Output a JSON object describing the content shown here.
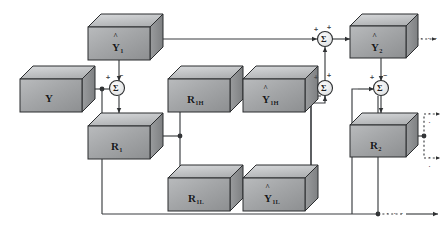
{
  "diagram": {
    "background": "#ffffff",
    "line_color": "#3a3d40",
    "cube_face_color": "#a9abad",
    "cube_top_color": "#c9cbcd",
    "cube_side_color": "#8f9193",
    "cube_edge_color": "#2b2d2f",
    "nodes": [
      {
        "id": "Y",
        "label_base": "Y",
        "label_sub": "",
        "hat": false,
        "x": 20,
        "y": 66,
        "w": 62,
        "h": 46,
        "d": 13
      },
      {
        "id": "Y1",
        "label_base": "Y",
        "label_sub": "1",
        "hat": true,
        "x": 88,
        "y": 14,
        "w": 62,
        "h": 46,
        "d": 13
      },
      {
        "id": "R1",
        "label_base": "R",
        "label_sub": "1",
        "hat": false,
        "x": 88,
        "y": 113,
        "w": 62,
        "h": 46,
        "d": 13
      },
      {
        "id": "R1H",
        "label_base": "R",
        "label_sub": "1H",
        "hat": false,
        "x": 168,
        "y": 66,
        "w": 62,
        "h": 46,
        "d": 13
      },
      {
        "id": "Y1H",
        "label_base": "Y",
        "label_sub": "1H",
        "hat": true,
        "x": 243,
        "y": 66,
        "w": 62,
        "h": 46,
        "d": 13
      },
      {
        "id": "R1L",
        "label_base": "R",
        "label_sub": "1L",
        "hat": false,
        "x": 168,
        "y": 165,
        "w": 62,
        "h": 46,
        "d": 13
      },
      {
        "id": "Y1L",
        "label_base": "Y",
        "label_sub": "1L",
        "hat": true,
        "x": 243,
        "y": 165,
        "w": 62,
        "h": 46,
        "d": 13
      },
      {
        "id": "Y2",
        "label_base": "Y",
        "label_sub": "2",
        "hat": true,
        "x": 350,
        "y": 14,
        "w": 56,
        "h": 44,
        "d": 12
      },
      {
        "id": "R2",
        "label_base": "R",
        "label_sub": "2",
        "hat": false,
        "x": 350,
        "y": 113,
        "w": 56,
        "h": 44,
        "d": 12
      }
    ],
    "summation_nodes": [
      {
        "id": "sum-left",
        "symbol": "Σ",
        "cx": 117,
        "cy": 88,
        "r": 7.5,
        "signs": [
          {
            "t": "+",
            "x": 106,
            "y": 74
          },
          {
            "t": "−",
            "x": 119,
            "y": 72
          }
        ]
      },
      {
        "id": "sum-mid",
        "symbol": "Σ",
        "cx": 325,
        "cy": 88,
        "r": 7.5,
        "signs": [
          {
            "t": "+",
            "x": 314,
            "y": 74
          },
          {
            "t": "+",
            "x": 327,
            "y": 72
          }
        ]
      },
      {
        "id": "sum-top",
        "symbol": "Σ",
        "cx": 325,
        "cy": 39,
        "r": 7.5,
        "signs": [
          {
            "t": "+",
            "x": 314,
            "y": 26
          },
          {
            "t": "+",
            "x": 327,
            "y": 24
          }
        ]
      },
      {
        "id": "sum-right",
        "symbol": "Σ",
        "cx": 381,
        "cy": 88,
        "r": 7.5,
        "signs": [
          {
            "t": "+",
            "x": 370,
            "y": 74
          },
          {
            "t": "−",
            "x": 383,
            "y": 72
          }
        ]
      }
    ],
    "ellipses": [
      {
        "id": "ellipsis-top-right",
        "text": "· · ·",
        "x": 420,
        "y": 34
      },
      {
        "id": "ellipsis-right-upper",
        "text": "· · ·",
        "x": 432,
        "y": 115
      },
      {
        "id": "ellipsis-right-lower",
        "text": "· · ·",
        "x": 432,
        "y": 158
      },
      {
        "id": "ellipsis-bottom",
        "text": "· · ·",
        "x": 395,
        "y": 219
      }
    ]
  }
}
